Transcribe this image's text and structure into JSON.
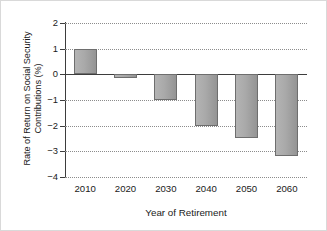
{
  "chart_data": {
    "type": "bar",
    "title": "",
    "subtitle": "",
    "xlabel": "Year of Retirement",
    "ylabel": "Rate of Return on Social Security Contributions (%)",
    "ylabel_line1": "Rate of Return on Social Security",
    "ylabel_line2": "Contributions (%)",
    "categories": [
      "2010",
      "2020",
      "2030",
      "2040",
      "2050",
      "2060"
    ],
    "values": [
      1.0,
      -0.15,
      -1.0,
      -2.0,
      -2.5,
      -3.2
    ],
    "ylim": [
      -4,
      2
    ],
    "yticks": [
      2,
      1,
      0,
      -1,
      -2,
      -3,
      -4
    ],
    "ytick_labels": [
      "2",
      "1",
      "0",
      "−1",
      "−2",
      "−3",
      "−4"
    ],
    "grid": "horizontal-dotted",
    "legend": "none",
    "bar_color": "#a9a9a9",
    "bar_edge_color": "#6e6e6e",
    "zero_line_color": "#3d3d3d",
    "grid_color": "#8c8c8c",
    "background_color": "#ffffff",
    "border_color": "#d9d9d9",
    "series": [
      {
        "name": "Rate of Return on Social Security Contributions (%)",
        "values": [
          1.0,
          -0.15,
          -1.0,
          -2.0,
          -2.5,
          -3.2
        ]
      }
    ],
    "points": [
      {
        "category": "2010",
        "value": 1.0
      },
      {
        "category": "2020",
        "value": -0.15
      },
      {
        "category": "2030",
        "value": -1.0
      },
      {
        "category": "2040",
        "value": -2.0
      },
      {
        "category": "2050",
        "value": -2.5
      },
      {
        "category": "2060",
        "value": -3.2
      }
    ]
  }
}
